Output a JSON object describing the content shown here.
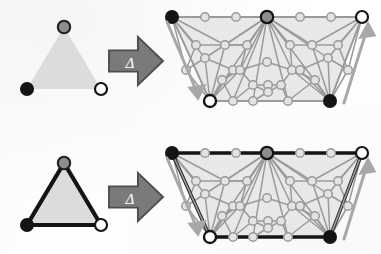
{
  "figure": {
    "operator_symbol": "Δ",
    "background_color": "#ffffff",
    "rows": [
      {
        "id": "row-top",
        "description": "Filled triangle without outlined edges maps to triangulated trapezoid mesh with light boundary",
        "source_shape": {
          "name": "triangle-unbordered",
          "fill_color": "#dcdcdc",
          "edge_color": "none",
          "edge_style": "none",
          "vertices": [
            {
              "id": "apex",
              "marker": "gray-filled-circle",
              "fill": "#8c8c8c",
              "stroke": "#1a1a1a"
            },
            {
              "id": "bottom-left",
              "marker": "black-filled-circle",
              "fill": "#141414",
              "stroke": "#141414"
            },
            {
              "id": "bottom-right",
              "marker": "white-filled-circle",
              "fill": "#ffffff",
              "stroke": "#141414"
            }
          ]
        },
        "arrow": {
          "name": "delta-arrow",
          "label": "Δ",
          "fill": "#7a7a7a",
          "stroke": "#4d4d4d",
          "label_color": "#ffffff"
        },
        "result_mesh": {
          "name": "mesh-light-boundary",
          "outline": "light",
          "face_fill": "#e8e8e8",
          "edge_color": "#9a9a9a",
          "boundary_color": "#9a9a9a",
          "corner_vertices": [
            {
              "id": "top-left",
              "marker": "black-filled-circle",
              "fill": "#141414",
              "stroke": "#141414"
            },
            {
              "id": "top-mid",
              "marker": "gray-filled-circle",
              "fill": "#8c8c8c",
              "stroke": "#141414"
            },
            {
              "id": "top-right",
              "marker": "white-filled-circle",
              "fill": "#ffffff",
              "stroke": "#141414"
            },
            {
              "id": "bottom-left",
              "marker": "white-filled-circle",
              "fill": "#ffffff",
              "stroke": "#141414"
            },
            {
              "id": "bottom-right",
              "marker": "black-filled-circle",
              "fill": "#141414",
              "stroke": "#141414"
            }
          ],
          "direction_arrows": [
            {
              "id": "left-down-arrow",
              "direction": "down-right",
              "color": "#a8a8a8"
            },
            {
              "id": "right-up-arrow",
              "direction": "up-right",
              "color": "#a8a8a8"
            }
          ]
        }
      },
      {
        "id": "row-bottom",
        "description": "Filled triangle with dark outlined edges maps to triangulated trapezoid mesh with dark boundary",
        "source_shape": {
          "name": "triangle-bordered",
          "fill_color": "#dcdcdc",
          "edge_color": "#141414",
          "edge_style": "solid-thick",
          "vertices": [
            {
              "id": "apex",
              "marker": "gray-filled-circle",
              "fill": "#8c8c8c",
              "stroke": "#1a1a1a"
            },
            {
              "id": "bottom-left",
              "marker": "black-filled-circle",
              "fill": "#141414",
              "stroke": "#141414"
            },
            {
              "id": "bottom-right",
              "marker": "white-filled-circle",
              "fill": "#ffffff",
              "stroke": "#141414"
            }
          ]
        },
        "arrow": {
          "name": "delta-arrow",
          "label": "Δ",
          "fill": "#7a7a7a",
          "stroke": "#4d4d4d",
          "label_color": "#ffffff"
        },
        "result_mesh": {
          "name": "mesh-dark-boundary",
          "outline": "dark",
          "face_fill": "#e8e8e8",
          "edge_color": "#9a9a9a",
          "boundary_color": "#141414",
          "corner_vertices": [
            {
              "id": "top-left",
              "marker": "black-filled-circle",
              "fill": "#141414",
              "stroke": "#141414"
            },
            {
              "id": "top-mid",
              "marker": "gray-filled-circle",
              "fill": "#8c8c8c",
              "stroke": "#141414"
            },
            {
              "id": "top-right",
              "marker": "white-filled-circle",
              "fill": "#ffffff",
              "stroke": "#141414"
            },
            {
              "id": "bottom-left",
              "marker": "white-filled-circle",
              "fill": "#ffffff",
              "stroke": "#141414"
            },
            {
              "id": "bottom-right",
              "marker": "black-filled-circle",
              "fill": "#141414",
              "stroke": "#141414"
            }
          ],
          "direction_arrows": [
            {
              "id": "left-down-arrow",
              "direction": "down-right",
              "color": "#a8a8a8"
            },
            {
              "id": "right-up-arrow",
              "direction": "up-right",
              "color": "#a8a8a8"
            }
          ]
        }
      }
    ],
    "colors": {
      "face_fill": "#e8e8e8",
      "mesh_edge": "#9a9a9a",
      "mesh_node_fill": "#e0e0e0",
      "mesh_node_stroke": "#9a9a9a",
      "dark": "#141414",
      "gray": "#8c8c8c",
      "white": "#ffffff",
      "arrow_fill": "#7a7a7a",
      "arrow_stroke": "#4d4d4d",
      "guide_arrow": "#a8a8a8"
    }
  }
}
